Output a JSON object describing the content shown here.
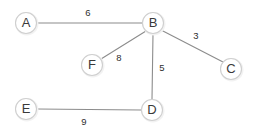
{
  "diagram": {
    "type": "node-link-graph",
    "canvas": {
      "width": 254,
      "height": 133
    },
    "colors": {
      "background": "#ffffff",
      "node_fill": "#ffffff",
      "node_stroke": "#cfcfcf",
      "node_halo": "#f2f2f2",
      "edge_stroke": "#8c8c8c",
      "node_label_text": "#3a3a3a",
      "weight_text": "#2e2e2e"
    },
    "nodes": [
      {
        "id": "A",
        "label": "A",
        "cx": 26,
        "cy": 23,
        "r": 10.5
      },
      {
        "id": "B",
        "label": "B",
        "cx": 153,
        "cy": 23,
        "r": 10.5
      },
      {
        "id": "C",
        "label": "C",
        "cx": 231,
        "cy": 69,
        "r": 10.5
      },
      {
        "id": "D",
        "label": "D",
        "cx": 152,
        "cy": 110,
        "r": 10.5
      },
      {
        "id": "E",
        "label": "E",
        "cx": 26,
        "cy": 109,
        "r": 10.5
      },
      {
        "id": "F",
        "label": "F",
        "cx": 92,
        "cy": 65,
        "r": 10.5
      }
    ],
    "edges": [
      {
        "from": "A",
        "to": "B",
        "weight": "6",
        "x1": 37,
        "y1": 23,
        "x2": 143,
        "y2": 23,
        "label_x": 88,
        "label_y": 13
      },
      {
        "from": "B",
        "to": "C",
        "weight": "3",
        "x1": 161,
        "y1": 30,
        "x2": 223,
        "y2": 62,
        "label_x": 196,
        "label_y": 36
      },
      {
        "from": "B",
        "to": "F",
        "weight": "8",
        "x1": 146,
        "y1": 31,
        "x2": 101,
        "y2": 59,
        "label_x": 119,
        "label_y": 58
      },
      {
        "from": "B",
        "to": "D",
        "weight": "5",
        "x1": 153,
        "y1": 34,
        "x2": 152,
        "y2": 99,
        "label_x": 162,
        "label_y": 68
      },
      {
        "from": "E",
        "to": "D",
        "weight": "9",
        "x1": 37,
        "y1": 109,
        "x2": 141,
        "y2": 110,
        "label_x": 84,
        "label_y": 122
      }
    ]
  }
}
